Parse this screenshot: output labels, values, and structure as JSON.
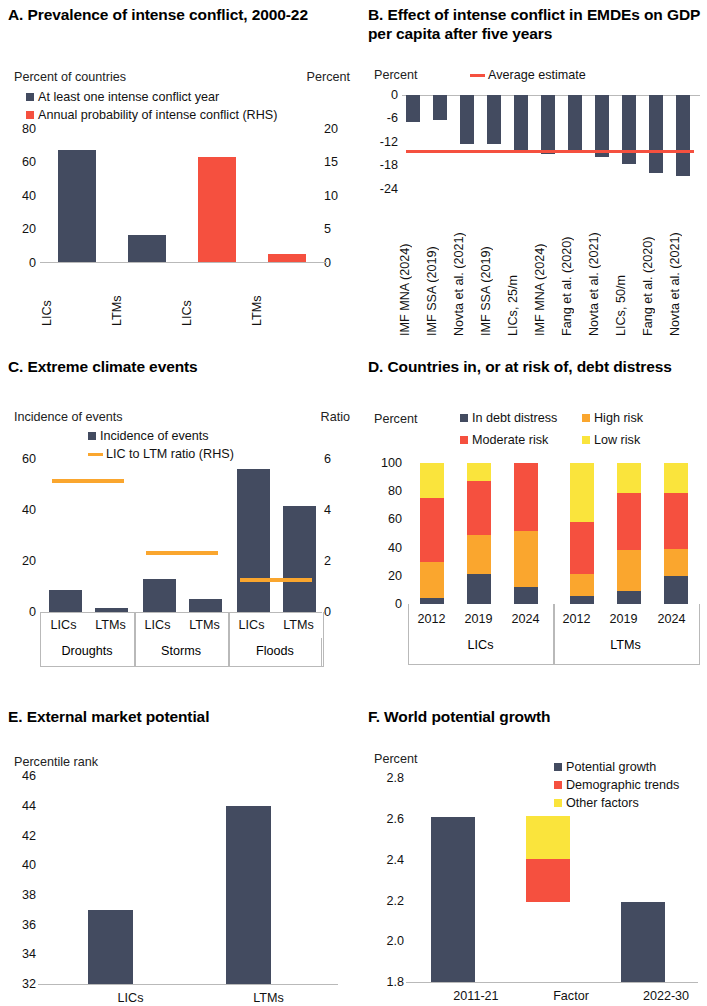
{
  "figure": {
    "colors": {
      "navy": "#434B60",
      "red": "#F5503F",
      "orange": "#FAA62E",
      "yellow": "#FAE43C",
      "axis": "#b9b9b9"
    }
  },
  "panels": {
    "A": {
      "title": "A. Prevalence of intense conflict, 2000-22",
      "left_axis_label": "Percent of countries",
      "right_axis_label": "Percent",
      "legend": [
        {
          "label": "At least one intense conflict year",
          "color": "#434B60",
          "type": "square"
        },
        {
          "label": "Annual probability of intense conflict (RHS)",
          "color": "#F5503F",
          "type": "square"
        }
      ],
      "left_ticks": [
        "80",
        "60",
        "40",
        "20",
        "0"
      ],
      "right_ticks": [
        "20",
        "15",
        "10",
        "5",
        "0"
      ],
      "categories": [
        "LICs",
        "LTMs",
        "LICs",
        "LTMs"
      ]
    },
    "B": {
      "title": "B. Effect of intense conflict in EMDEs on GDP per capita after five years",
      "left_axis_label": "Percent",
      "legend": [
        {
          "label": "Average estimate",
          "color": "#F5503F",
          "type": "line"
        }
      ],
      "left_ticks": [
        "0",
        "-6",
        "-12",
        "-18",
        "-24"
      ],
      "categories": [
        "IMF MNA (2024)",
        "IMF SSA (2019)",
        "Novta et al. (2021)",
        "IMF SSA (2019)",
        "LICs, 25/m",
        "IMF MNA (2024)",
        "Fang et al. (2020)",
        "Novta et al. (2021)",
        "LICs, 50/m",
        "Fang et al. (2020)",
        "Novta et al. (2021)"
      ]
    },
    "C": {
      "title": "C. Extreme climate events",
      "left_axis_label": "Incidence of events",
      "right_axis_label": "Ratio",
      "legend": [
        {
          "label": "Incidence of events",
          "color": "#434B60",
          "type": "square"
        },
        {
          "label": "LIC to LTM ratio (RHS)",
          "color": "#FAA62E",
          "type": "line"
        }
      ],
      "left_ticks": [
        "60",
        "40",
        "20",
        "0"
      ],
      "right_ticks": [
        "6",
        "4",
        "2",
        "0"
      ],
      "categories": [
        "LICs",
        "LTMs",
        "LICs",
        "LTMs",
        "LICs",
        "LTMs"
      ],
      "groups": [
        "Droughts",
        "Storms",
        "Floods"
      ]
    },
    "D": {
      "title": "D. Countries in, or at risk of, debt distress",
      "left_axis_label": "Percent",
      "legend": [
        {
          "label": "In debt distress",
          "color": "#434B60",
          "type": "square"
        },
        {
          "label": "High risk",
          "color": "#FAA62E",
          "type": "square"
        },
        {
          "label": "Moderate risk",
          "color": "#F5503F",
          "type": "square"
        },
        {
          "label": "Low risk",
          "color": "#FAE43C",
          "type": "square"
        }
      ],
      "left_ticks": [
        "100",
        "80",
        "60",
        "40",
        "20",
        "0"
      ],
      "categories": [
        "2012",
        "2019",
        "2024",
        "2012",
        "2019",
        "2024"
      ],
      "groups": [
        "LICs",
        "LTMs"
      ]
    },
    "E": {
      "title": "E. External market potential",
      "left_axis_label": "Percentile rank",
      "left_ticks": [
        "46",
        "44",
        "42",
        "40",
        "38",
        "36",
        "34",
        "32"
      ],
      "categories": [
        "LICs",
        "LTMs"
      ]
    },
    "F": {
      "title": "F. World potential growth",
      "left_axis_label": "Percent",
      "legend": [
        {
          "label": "Potential growth",
          "color": "#434B60",
          "type": "square"
        },
        {
          "label": "Demographic trends",
          "color": "#F5503F",
          "type": "square"
        },
        {
          "label": "Other factors",
          "color": "#FAE43C",
          "type": "square"
        }
      ],
      "left_ticks": [
        "2.8",
        "2.6",
        "2.4",
        "2.2",
        "2.0",
        "1.8"
      ],
      "categories": [
        "2011-21",
        "Factor",
        "2022-30"
      ]
    }
  },
  "chart_data": [
    {
      "panel": "A",
      "type": "bar",
      "title": "A. Prevalence of intense conflict, 2000-22",
      "xlabel": "",
      "ylabel": "Percent of countries",
      "y2label": "Percent",
      "ylim": [
        0,
        80
      ],
      "y2lim": [
        0,
        20
      ],
      "grid": false,
      "categories": [
        "LICs",
        "LTMs",
        "LICs",
        "LTMs"
      ],
      "series": [
        {
          "name": "At least one intense conflict year",
          "axis": "left",
          "color": "#434B60",
          "values": [
            67,
            16,
            null,
            null
          ]
        },
        {
          "name": "Annual probability of intense conflict (RHS)",
          "axis": "right",
          "color": "#F5503F",
          "values": [
            null,
            null,
            15.7,
            1.1
          ]
        }
      ]
    },
    {
      "panel": "B",
      "type": "bar",
      "title": "B. Effect of intense conflict in EMDEs on GDP per capita after five years",
      "xlabel": "",
      "ylabel": "Percent",
      "ylim": [
        -24,
        0
      ],
      "grid": false,
      "categories": [
        "IMF MNA (2024)",
        "IMF SSA (2019)",
        "Novta et al. (2021)",
        "IMF SSA (2019)",
        "LICs, 25/m",
        "IMF MNA (2024)",
        "Fang et al. (2020)",
        "Novta et al. (2021)",
        "LICs, 50/m",
        "Fang et al. (2020)",
        "Novta et al. (2021)"
      ],
      "values": [
        -7.0,
        -6.5,
        -12.5,
        -12.5,
        -14.5,
        -15.0,
        -14.8,
        -15.8,
        -17.6,
        -20.0,
        -20.6
      ],
      "annotations": [
        {
          "name": "Average estimate",
          "type": "hline",
          "value": -14.2,
          "color": "#F5503F"
        }
      ]
    },
    {
      "panel": "C",
      "type": "bar",
      "title": "C. Extreme climate events",
      "xlabel": "",
      "ylabel": "Incidence of events",
      "y2label": "Ratio",
      "ylim": [
        0,
        60
      ],
      "y2lim": [
        0,
        6
      ],
      "grid": false,
      "categories": [
        "LICs",
        "LTMs",
        "LICs",
        "LTMs",
        "LICs",
        "LTMs"
      ],
      "groups": [
        "Droughts",
        "Storms",
        "Floods"
      ],
      "series": [
        {
          "name": "Incidence of events",
          "axis": "left",
          "color": "#434B60",
          "values": [
            8.5,
            1.5,
            13.0,
            5.0,
            56.0,
            41.5
          ]
        },
        {
          "name": "LIC to LTM ratio (RHS)",
          "axis": "right",
          "color": "#FAA62E",
          "type": "marker",
          "group_values": [
            5.2,
            2.4,
            1.35
          ]
        }
      ]
    },
    {
      "panel": "D",
      "type": "bar",
      "stacked": true,
      "title": "D. Countries in, or at risk of, debt distress",
      "xlabel": "",
      "ylabel": "Percent",
      "ylim": [
        0,
        100
      ],
      "grid": false,
      "categories": [
        "2012",
        "2019",
        "2024",
        "2012",
        "2019",
        "2024"
      ],
      "groups": [
        "LICs",
        "LTMs"
      ],
      "series": [
        {
          "name": "In debt distress",
          "color": "#434B60",
          "values": [
            4,
            21,
            12,
            6,
            9,
            20
          ]
        },
        {
          "name": "High risk",
          "color": "#FAA62E",
          "values": [
            26,
            28,
            40,
            15,
            29,
            19
          ]
        },
        {
          "name": "Moderate risk",
          "color": "#F5503F",
          "values": [
            45,
            38,
            48,
            37,
            41,
            40
          ]
        },
        {
          "name": "Low risk",
          "color": "#FAE43C",
          "values": [
            25,
            13,
            0,
            42,
            21,
            21
          ]
        }
      ]
    },
    {
      "panel": "E",
      "type": "bar",
      "title": "E. External market potential",
      "xlabel": "",
      "ylabel": "Percentile rank",
      "ylim": [
        32,
        46
      ],
      "grid": false,
      "categories": [
        "LICs",
        "LTMs"
      ],
      "values": [
        37.0,
        44.0
      ],
      "color": "#434B60"
    },
    {
      "panel": "F",
      "type": "bar",
      "title": "F. World potential growth",
      "xlabel": "",
      "ylabel": "Percent",
      "ylim": [
        1.8,
        2.8
      ],
      "grid": false,
      "categories": [
        "2011-21",
        "Factor",
        "2022-30"
      ],
      "series": [
        {
          "name": "Potential growth",
          "color": "#434B60",
          "bars": [
            {
              "cat": "2011-21",
              "base": 1.8,
              "top": 2.61
            },
            {
              "cat": "2022-30",
              "base": 1.8,
              "top": 2.19
            }
          ]
        },
        {
          "name": "Demographic trends",
          "color": "#F5503F",
          "bars": [
            {
              "cat": "Factor",
              "base": 2.19,
              "top": 2.4
            }
          ]
        },
        {
          "name": "Other factors",
          "color": "#FAE43C",
          "bars": [
            {
              "cat": "Factor",
              "base": 2.4,
              "top": 2.61
            }
          ]
        }
      ]
    }
  ]
}
